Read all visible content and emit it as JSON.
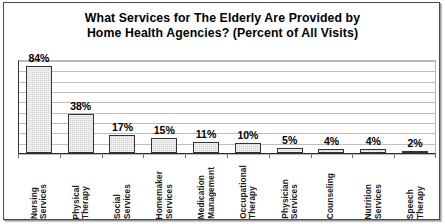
{
  "chart_data": {
    "type": "bar",
    "title": "What Services for The Elderly Are Provided by Home Health Agencies? (Percent of All Visits)",
    "title_lines": [
      "What Services for The Elderly Are Provided by",
      "Home Health Agencies? (Percent of All Visits)"
    ],
    "categories": [
      "Nursing Services",
      "Physical Therapy",
      "Social Services",
      "Homemaker Services",
      "Medication Management",
      "Occupational Therapy",
      "Physician Services",
      "Counseling",
      "Nutrition Services",
      "Speech Therapy"
    ],
    "category_lines": [
      [
        "Nursing",
        "Services"
      ],
      [
        "Physical",
        "Therapy"
      ],
      [
        "Social",
        "Services"
      ],
      [
        "Homemaker",
        "Services"
      ],
      [
        "Medication",
        "Management"
      ],
      [
        "Occupational",
        "Therapy"
      ],
      [
        "Physician",
        "Services"
      ],
      [
        "Counseling"
      ],
      [
        "Nutrition",
        "Services"
      ],
      [
        "Speech",
        "Therapy"
      ]
    ],
    "values": [
      84,
      38,
      17,
      15,
      11,
      10,
      5,
      4,
      4,
      2
    ],
    "value_labels": [
      "84%",
      "38%",
      "17%",
      "15%",
      "11%",
      "10%",
      "5%",
      "4%",
      "4%",
      "2%"
    ],
    "xlabel": "",
    "ylabel": "",
    "ylim": [
      0,
      90
    ],
    "y_gridline_step": 10,
    "grid": true,
    "y_axis_tick_labels_shown": false,
    "legend": "none",
    "colors": {
      "bar_fill": "#d4d4d4",
      "bar_fill_small": "#9a9a9a",
      "bar_border": "#333333",
      "gridline": "#bdbdbd",
      "axis": "#2b2b2b",
      "text": "#000000",
      "background": "#ffffff",
      "frame": "#4a4a4a"
    }
  }
}
